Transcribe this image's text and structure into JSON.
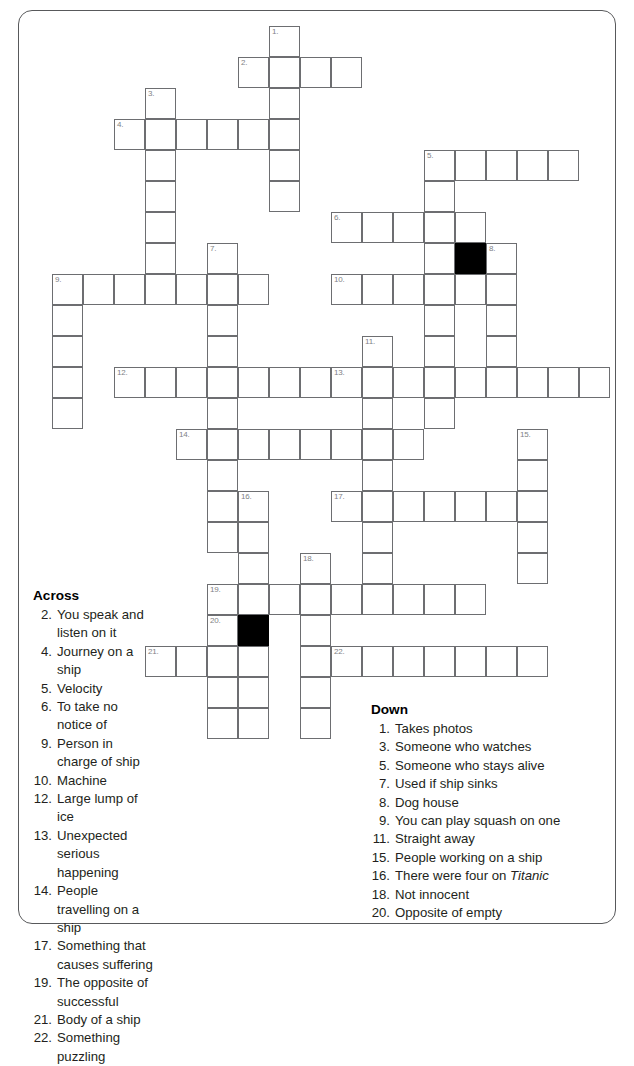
{
  "document": {
    "type": "crossword-puzzle-worksheet",
    "theme": "Titanic / ships"
  },
  "grid": {
    "origin_x": 52,
    "origin_y": 26,
    "cell_size": 31,
    "cols": 18,
    "rows": 23,
    "black_squares": [
      {
        "col": 13,
        "row": 7
      },
      {
        "col": 6,
        "row": 19
      }
    ],
    "entries": [
      {
        "number": 1,
        "direction": "down",
        "col": 7,
        "row": 0,
        "length": 6
      },
      {
        "number": 2,
        "direction": "across",
        "col": 6,
        "row": 1,
        "length": 4
      },
      {
        "number": 3,
        "direction": "down",
        "col": 3,
        "row": 2,
        "length": 6
      },
      {
        "number": 4,
        "direction": "across",
        "col": 2,
        "row": 3,
        "length": 6
      },
      {
        "number": 5,
        "direction": "across",
        "col": 12,
        "row": 4,
        "length": 5
      },
      {
        "number": 5,
        "direction": "down",
        "col": 12,
        "row": 4,
        "length": 9
      },
      {
        "number": 6,
        "direction": "across",
        "col": 9,
        "row": 6,
        "length": 5
      },
      {
        "number": 7,
        "direction": "down",
        "col": 5,
        "row": 7,
        "length": 10
      },
      {
        "number": 8,
        "direction": "down",
        "col": 14,
        "row": 7,
        "length": 4
      },
      {
        "number": 9,
        "direction": "across",
        "col": 0,
        "row": 8,
        "length": 7
      },
      {
        "number": 9,
        "direction": "down",
        "col": 0,
        "row": 8,
        "length": 5
      },
      {
        "number": 10,
        "direction": "across",
        "col": 9,
        "row": 8,
        "length": 6
      },
      {
        "number": 11,
        "direction": "down",
        "col": 10,
        "row": 10,
        "length": 9
      },
      {
        "number": 12,
        "direction": "across",
        "col": 2,
        "row": 11,
        "length": 7
      },
      {
        "number": 13,
        "direction": "across",
        "col": 9,
        "row": 11,
        "length": 9
      },
      {
        "number": 14,
        "direction": "across",
        "col": 4,
        "row": 13,
        "length": 8
      },
      {
        "number": 15,
        "direction": "down",
        "col": 15,
        "row": 13,
        "length": 5
      },
      {
        "number": 16,
        "direction": "down",
        "col": 6,
        "row": 15,
        "length": 8
      },
      {
        "number": 17,
        "direction": "across",
        "col": 9,
        "row": 15,
        "length": 7
      },
      {
        "number": 18,
        "direction": "down",
        "col": 8,
        "row": 17,
        "length": 6
      },
      {
        "number": 19,
        "direction": "across",
        "col": 5,
        "row": 18,
        "length": 9
      },
      {
        "number": 20,
        "direction": "down",
        "col": 5,
        "row": 19,
        "length": 4
      },
      {
        "number": 21,
        "direction": "across",
        "col": 3,
        "row": 20,
        "length": 3
      },
      {
        "number": 22,
        "direction": "across",
        "col": 9,
        "row": 20,
        "length": 7
      }
    ]
  },
  "across": {
    "heading": "Across",
    "clues": [
      {
        "number": "2.",
        "text": "You speak and listen on it"
      },
      {
        "number": "4.",
        "text": "Journey on a ship"
      },
      {
        "number": "5.",
        "text": "Velocity"
      },
      {
        "number": "6.",
        "text": "To take no notice of"
      },
      {
        "number": "9.",
        "text": "Person in charge of ship"
      },
      {
        "number": "10.",
        "text": "Machine"
      },
      {
        "number": "12.",
        "text": "Large lump of ice"
      },
      {
        "number": "13.",
        "text": "Unexpected serious happening"
      },
      {
        "number": "14.",
        "text": "People travelling on a ship"
      },
      {
        "number": "17.",
        "text": "Something that causes suffering"
      },
      {
        "number": "19.",
        "text": "The opposite of successful"
      },
      {
        "number": "21.",
        "text": "Body of a ship"
      },
      {
        "number": "22.",
        "text": "Something puzzling"
      }
    ]
  },
  "down": {
    "heading": "Down",
    "clues": [
      {
        "number": "1.",
        "text": "Takes photos"
      },
      {
        "number": "3.",
        "text": "Someone who watches"
      },
      {
        "number": "5.",
        "text": "Someone who stays alive"
      },
      {
        "number": "7.",
        "text": "Used if ship sinks"
      },
      {
        "number": "8.",
        "text": "Dog house"
      },
      {
        "number": "9.",
        "text": "You can play squash on one"
      },
      {
        "number": "11.",
        "text": "Straight away"
      },
      {
        "number": "15.",
        "text": "People working on a ship"
      },
      {
        "number": "16.",
        "text": "There were four on ",
        "italic": "Titanic"
      },
      {
        "number": "18.",
        "text": "Not innocent"
      },
      {
        "number": "20.",
        "text": "Opposite of empty"
      }
    ]
  },
  "colors": {
    "frame": "#58595b",
    "cell_border": "#6d6e71",
    "cell_number": "#808285",
    "black_square": "#000000",
    "text": "#231f20"
  }
}
